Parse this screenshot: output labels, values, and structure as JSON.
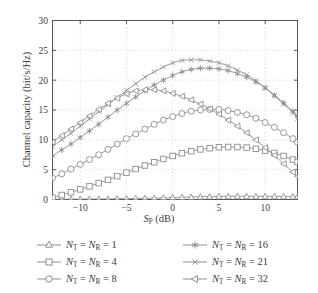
{
  "chart_data": {
    "type": "line",
    "title": "",
    "xlabel": "S_P (dB)",
    "xlabel_main": "S",
    "xlabel_sub": "P",
    "xlabel_unit": " (dB)",
    "ylabel": "Channel capacity (bit/s/Hz)",
    "xlim": [
      -13.0,
      13.5
    ],
    "ylim": [
      0,
      30
    ],
    "xticks": [
      -10,
      -5,
      0,
      5,
      10
    ],
    "xtick_labels": [
      "−10",
      "−5",
      "0",
      "5",
      "10"
    ],
    "yticks": [
      0,
      5,
      10,
      15,
      20,
      25,
      30
    ],
    "ytick_labels": [
      "0",
      "5",
      "10",
      "15",
      "20",
      "25",
      "30"
    ],
    "grid": true,
    "grid_style": "dotted",
    "legend_position": "below-plot",
    "line_color": "#8d8d8d",
    "axis_color": "#555555",
    "grid_color": "#c8c8c8",
    "series": [
      {
        "name": "N_T = N_R = 1",
        "marker": "triangle-up",
        "x": [
          -13,
          -12,
          -11,
          -10,
          -9,
          -8,
          -7,
          -6,
          -5,
          -4,
          -3,
          -2,
          -1,
          0,
          1,
          2,
          3,
          4,
          5,
          6,
          7,
          8,
          9,
          10,
          11,
          12,
          13,
          13.5
        ],
        "values": [
          0.05,
          0.05,
          0.06,
          0.07,
          0.08,
          0.09,
          0.1,
          0.12,
          0.14,
          0.17,
          0.2,
          0.24,
          0.28,
          0.33,
          0.38,
          0.43,
          0.47,
          0.5,
          0.52,
          0.54,
          0.55,
          0.55,
          0.55,
          0.54,
          0.53,
          0.52,
          0.5,
          0.5
        ]
      },
      {
        "name": "N_T = N_R = 4",
        "marker": "square",
        "x": [
          -13,
          -12,
          -11,
          -10,
          -9,
          -8,
          -7,
          -6,
          -5,
          -4,
          -3,
          -2,
          -1,
          0,
          1,
          2,
          3,
          4,
          5,
          6,
          7,
          8,
          9,
          10,
          11,
          12,
          13,
          13.5
        ],
        "values": [
          0.3,
          0.75,
          1.2,
          1.7,
          2.2,
          2.75,
          3.3,
          3.9,
          4.5,
          5.1,
          5.7,
          6.25,
          6.8,
          7.3,
          7.75,
          8.1,
          8.4,
          8.6,
          8.75,
          8.8,
          8.8,
          8.7,
          8.5,
          8.2,
          7.8,
          7.3,
          6.7,
          6.3
        ]
      },
      {
        "name": "N_T = N_R = 8",
        "marker": "circle",
        "x": [
          -13,
          -12,
          -11,
          -10,
          -9,
          -8,
          -7,
          -6,
          -5,
          -4,
          -3,
          -2,
          -1,
          0,
          1,
          2,
          3,
          4,
          5,
          6,
          7,
          8,
          9,
          10,
          11,
          12,
          13,
          13.5
        ],
        "values": [
          3.6,
          4.3,
          5.1,
          5.9,
          6.7,
          7.5,
          8.4,
          9.3,
          10.2,
          11.0,
          11.8,
          12.6,
          13.3,
          13.9,
          14.4,
          14.8,
          15.0,
          15.1,
          15.1,
          14.9,
          14.6,
          14.2,
          13.6,
          12.9,
          12.1,
          11.2,
          10.2,
          9.6
        ]
      },
      {
        "name": "N_T = N_R = 16",
        "marker": "asterisk",
        "x": [
          -13,
          -12,
          -11,
          -10,
          -9,
          -8,
          -7,
          -6,
          -5,
          -4,
          -3,
          -2,
          -1,
          0,
          1,
          2,
          3,
          4,
          5,
          6,
          7,
          8,
          9,
          10,
          11,
          12,
          13,
          13.5
        ],
        "values": [
          7.3,
          8.3,
          9.3,
          10.4,
          11.5,
          12.6,
          13.8,
          15.0,
          16.1,
          17.2,
          18.2,
          19.2,
          20.0,
          20.8,
          21.4,
          21.8,
          22.0,
          22.0,
          21.9,
          21.6,
          21.1,
          20.5,
          19.7,
          18.7,
          17.5,
          16.2,
          14.8,
          14.0
        ]
      },
      {
        "name": "N_T = N_R = 21",
        "marker": "x-thin",
        "x": [
          -13,
          -12,
          -11,
          -10,
          -9,
          -8,
          -7,
          -6,
          -5,
          -4,
          -3,
          -2,
          -1,
          0,
          1,
          2,
          3,
          4,
          5,
          6,
          7,
          8,
          9,
          10,
          11,
          12,
          13,
          13.5
        ],
        "values": [
          8.9,
          10.0,
          11.1,
          12.3,
          13.5,
          14.7,
          15.9,
          17.1,
          18.3,
          19.4,
          20.5,
          21.4,
          22.2,
          22.9,
          23.3,
          23.4,
          23.4,
          23.2,
          22.9,
          22.4,
          21.7,
          20.9,
          19.9,
          18.7,
          17.4,
          16.0,
          14.5,
          13.6
        ]
      },
      {
        "name": "N_T = N_R = 32",
        "marker": "triangle-left",
        "x": [
          -13,
          -12,
          -11,
          -10,
          -9,
          -8,
          -7,
          -6,
          -5,
          -4,
          -3,
          -2,
          -1,
          0,
          1,
          2,
          3,
          4,
          5,
          6,
          7,
          8,
          9,
          10,
          11,
          12,
          13,
          13.5
        ],
        "values": [
          9.6,
          10.7,
          11.8,
          12.9,
          14.0,
          15.1,
          16.1,
          17.0,
          17.7,
          18.2,
          18.4,
          18.4,
          18.2,
          17.8,
          17.3,
          16.7,
          16.0,
          15.2,
          14.3,
          13.3,
          12.3,
          11.2,
          10.0,
          8.7,
          7.4,
          6.0,
          4.6,
          3.9
        ]
      }
    ]
  },
  "legend": {
    "items": [
      {
        "marker": "triangle-up",
        "prefix": "N",
        "sub1": "T",
        "eq": " = ",
        "prefix2": "N",
        "sub2": "R",
        "eq2": " = ",
        "value": "1"
      },
      {
        "marker": "square",
        "prefix": "N",
        "sub1": "T",
        "eq": " = ",
        "prefix2": "N",
        "sub2": "R",
        "eq2": " = ",
        "value": "4"
      },
      {
        "marker": "circle",
        "prefix": "N",
        "sub1": "T",
        "eq": " = ",
        "prefix2": "N",
        "sub2": "R",
        "eq2": " = ",
        "value": "8"
      },
      {
        "marker": "asterisk",
        "prefix": "N",
        "sub1": "T",
        "eq": " = ",
        "prefix2": "N",
        "sub2": "R",
        "eq2": " = ",
        "value": "16"
      },
      {
        "marker": "x-thin",
        "prefix": "N",
        "sub1": "T",
        "eq": " = ",
        "prefix2": "N",
        "sub2": "R",
        "eq2": " = ",
        "value": "21"
      },
      {
        "marker": "triangle-left",
        "prefix": "N",
        "sub1": "T",
        "eq": " = ",
        "prefix2": "N",
        "sub2": "R",
        "eq2": " = ",
        "value": "32"
      }
    ]
  }
}
